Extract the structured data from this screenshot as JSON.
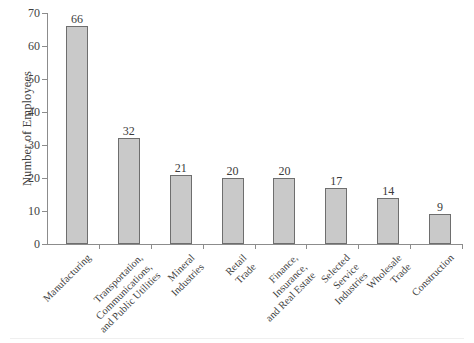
{
  "chart_data": {
    "type": "bar",
    "title": "",
    "xlabel": "",
    "ylabel": "Number of Employees",
    "ylim": [
      0,
      70
    ],
    "ytick_step": 10,
    "yticks": [
      0,
      10,
      20,
      30,
      40,
      50,
      60,
      70
    ],
    "ytick_labels": [
      "0",
      "10",
      "20",
      "30",
      "40",
      "50",
      "60",
      "70"
    ],
    "grid": false,
    "legend": false,
    "bar_fill_color": "#c9c9c9",
    "bar_border_color": "#6e6e6e",
    "axis_color": "#8c8c8c",
    "background_color": "#ffffff",
    "categories": [
      "Manufacturing",
      "Transportation, Communications, and Public Utilities",
      "Mineral Industries",
      "Retail Trade",
      "Finance, Insurance, and Real Estate",
      "Selected Service Industries",
      "Wholesale Trade",
      "Construction"
    ],
    "category_lines": [
      [
        "Manufacturing"
      ],
      [
        "Transportation,",
        "Communications,",
        "and Public Utilities"
      ],
      [
        "Mineral",
        "Industries"
      ],
      [
        "Retail",
        "Trade"
      ],
      [
        "Finance,",
        "Insurance,",
        "and Real Estate"
      ],
      [
        "Selected",
        "Service",
        "Industries"
      ],
      [
        "Wholesale",
        "Trade"
      ],
      [
        "Construction"
      ]
    ],
    "values": [
      66,
      32,
      21,
      20,
      20,
      17,
      14,
      9
    ],
    "value_labels": [
      "66",
      "32",
      "21",
      "20",
      "20",
      "17",
      "14",
      "9"
    ]
  }
}
